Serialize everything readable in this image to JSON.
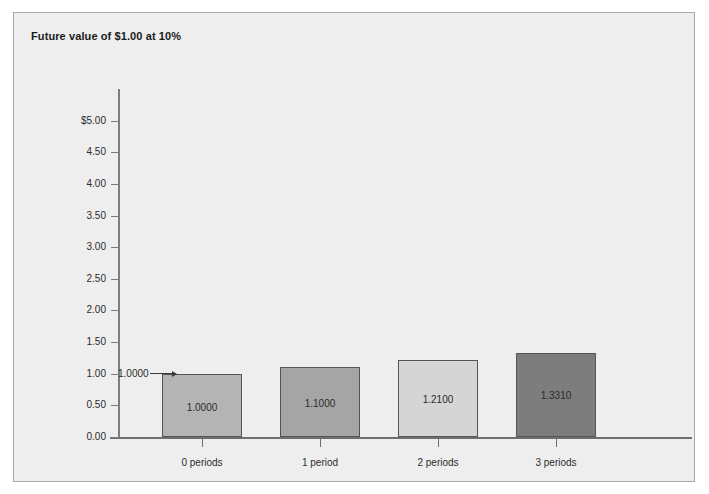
{
  "figure": {
    "background_color": "#ffffff",
    "panel_color": "#eeeeee",
    "panel_border_color": "#a8a8a8"
  },
  "title": "Future value of $1.00 at 10%",
  "annotation": {
    "label": "1.0000",
    "icon": "right-arrow-icon"
  },
  "chart_data": {
    "type": "bar",
    "title": "Future value of $1.00 at 10%",
    "xlabel": "",
    "ylabel": "",
    "categories": [
      "0 periods",
      "1 period",
      "2 periods",
      "3 periods"
    ],
    "values": [
      1.0,
      1.1,
      1.21,
      1.331
    ],
    "value_labels": [
      "1.0000",
      "1.1000",
      "1.2100",
      "1.3310"
    ],
    "bar_colors": [
      "#b4b4b4",
      "#a5a5a5",
      "#d5d5d5",
      "#7d7d7d"
    ],
    "bar_edge_color": "#555555",
    "ylim": [
      0.0,
      5.5
    ],
    "ytick_values": [
      5.0,
      4.5,
      4.0,
      3.5,
      3.0,
      2.5,
      2.0,
      1.5,
      1.0,
      0.5,
      0.0
    ],
    "ytick_labels": [
      "$5.00",
      "4.50",
      "4.00",
      "3.50",
      "3.00",
      "2.50",
      "2.00",
      "1.50",
      "1.00",
      "0.50",
      "0.00"
    ],
    "grid": false,
    "legend": false,
    "annotations": [
      {
        "text": "1.0000",
        "points_to_category": "0 periods",
        "points_to_value": 1.0
      }
    ]
  }
}
